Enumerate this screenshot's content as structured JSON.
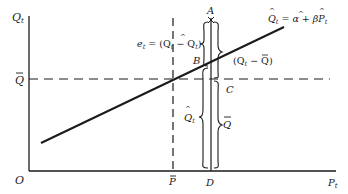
{
  "diagram": {
    "axes": {
      "y_label": "Q",
      "y_label_sub": "t",
      "x_label": "P",
      "x_label_sub": "t",
      "origin_label": "O"
    },
    "reference_lines": {
      "q_bar_label": "Q",
      "p_bar_label": "P"
    },
    "points": {
      "A": "A",
      "B": "B",
      "C": "C",
      "D": "D"
    },
    "equation": {
      "lhs": "Q",
      "lhs_sub": "t",
      "rhs_eq": " = ",
      "alpha": "α",
      "plus": " + ",
      "beta": "β",
      "var": "P",
      "var_sub": "t"
    },
    "annotations": {
      "residual": "e",
      "residual_sub": "t",
      "residual_rhs": " = (Q",
      "residual_rhs_sub": "t",
      "residual_minus": " − Q",
      "residual_minus_sub": "t",
      "residual_close": ")",
      "deviation_open": "(Q",
      "deviation_sub": "t",
      "deviation_minus": " − Q",
      "deviation_close": ")",
      "fitted_label": "Q",
      "fitted_sub": "t",
      "mean_label": "Q"
    },
    "colors": {
      "ink": "#1a1a1a",
      "background": "#ffffff"
    }
  }
}
